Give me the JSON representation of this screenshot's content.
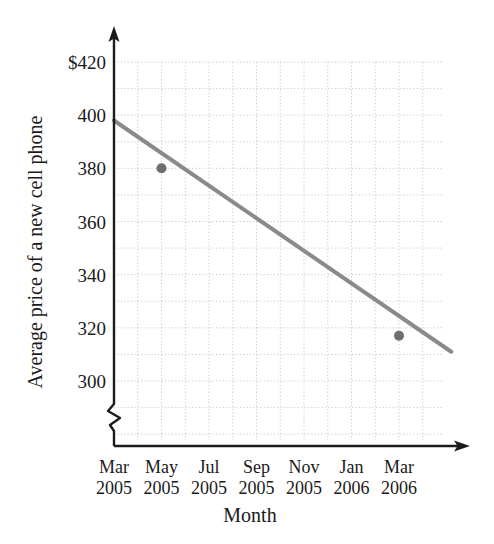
{
  "chart_data": {
    "type": "line",
    "title": "",
    "xlabel": "Month",
    "ylabel": "Average price of a new cell phone",
    "categories": [
      "Mar 2005",
      "May 2005",
      "Jul 2005",
      "Sep 2005",
      "Nov 2005",
      "Jan 2006",
      "Mar 2006"
    ],
    "x_tick_months": [
      "Mar",
      "May",
      "Jul",
      "Sep",
      "Nov",
      "Jan",
      "Mar"
    ],
    "x_tick_years": [
      "2005",
      "2005",
      "2005",
      "2005",
      "2005",
      "2006",
      "2006"
    ],
    "y_tick_labels": [
      "$420",
      "400",
      "380",
      "360",
      "340",
      "320",
      "300"
    ],
    "y_tick_values": [
      420,
      400,
      380,
      360,
      340,
      320,
      300
    ],
    "ylim": [
      296,
      424
    ],
    "y_axis_break": true,
    "grid": true,
    "grid_style": "dotted",
    "legend": "none",
    "series": [
      {
        "name": "Average price trend line",
        "style": "solid-line",
        "color": "#8a8a8a",
        "x": [
          "Mar 2005",
          "Mar 2006"
        ],
        "values": [
          398,
          311
        ],
        "endpoints": [
          {
            "x": "Mar 2005",
            "y": 398
          },
          {
            "x": "Mar 2006 +1mo",
            "y": 311
          }
        ]
      }
    ],
    "marked_points": [
      {
        "label": "May 2005",
        "x": "May 2005",
        "y": 380
      },
      {
        "label": "Mar 2006",
        "x": "Mar 2006",
        "y": 317
      }
    ],
    "colors": {
      "line": "#8a8a8a",
      "point": "#6e6e6e",
      "axis": "#1c1c1c",
      "grid": "#c9c9c9",
      "background": "#ffffff"
    }
  },
  "axis": {
    "y_label_text": "Average price of a new cell phone",
    "x_label_text": "Month"
  }
}
